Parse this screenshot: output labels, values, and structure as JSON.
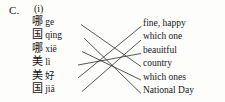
{
  "exercise": {
    "section_label": "C.",
    "part_label": "(i)",
    "type": "matching"
  },
  "left_column": {
    "name": "chinese-terms",
    "items": [
      {
        "id": "l1",
        "hanzi": "哪",
        "pinyin": "ge",
        "y": 25.2
      },
      {
        "id": "l2",
        "hanzi": "国",
        "pinyin": "qìng",
        "y": 38.6
      },
      {
        "id": "l3",
        "hanzi": "哪",
        "pinyin": "xiē",
        "y": 52.0
      },
      {
        "id": "l4",
        "hanzi": "美",
        "pinyin": "lì",
        "y": 65.4
      },
      {
        "id": "l5",
        "hanzi": "美",
        "pinyin": "好",
        "y": 78.8
      },
      {
        "id": "l6",
        "hanzi": "国",
        "pinyin": "jiā",
        "y": 92.2
      }
    ]
  },
  "right_column": {
    "name": "english-meanings",
    "items": [
      {
        "id": "r1",
        "text": "fine, happy",
        "y": 27.0
      },
      {
        "id": "r2",
        "text": "which one",
        "y": 40.4
      },
      {
        "id": "r3",
        "text": "beauitful",
        "y": 53.8
      },
      {
        "id": "r4",
        "text": "country",
        "y": 67.2
      },
      {
        "id": "r5",
        "text": "which ones",
        "y": 80.6
      },
      {
        "id": "r6",
        "text": "National Day",
        "y": 94.0
      }
    ]
  },
  "connections": [
    {
      "from": "l1",
      "to": "r4",
      "x1": 81,
      "y1": 24.5,
      "x2": 141,
      "y2": 66.5
    },
    {
      "from": "l2",
      "to": "r6",
      "x1": 84,
      "y1": 38.0,
      "x2": 141,
      "y2": 93.5
    },
    {
      "from": "l3",
      "to": "r5",
      "x1": 82,
      "y1": 51.5,
      "x2": 141,
      "y2": 80.0
    },
    {
      "from": "l4",
      "to": "r3",
      "x1": 78,
      "y1": 65.0,
      "x2": 141,
      "y2": 53.5
    },
    {
      "from": "l5",
      "to": "r1",
      "x1": 78,
      "y1": 78.0,
      "x2": 141,
      "y2": 26.5
    },
    {
      "from": "l6",
      "to": "r2",
      "x1": 82,
      "y1": 91.5,
      "x2": 141,
      "y2": 40.0
    }
  ],
  "style": {
    "line_color": "#2b2b2b",
    "text_color": "#161616",
    "background": "#fdfdfc"
  }
}
